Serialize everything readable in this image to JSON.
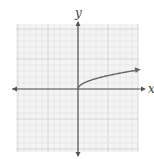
{
  "chart_data": {
    "type": "line",
    "title": "",
    "function": "y = sqrt(x)",
    "xlabel": "x",
    "ylabel": "y",
    "xlim": [
      -10,
      10
    ],
    "ylim": [
      -10,
      10
    ],
    "grid": true,
    "legend": null,
    "series": [
      {
        "name": "y = √x",
        "x": [
          0,
          0.25,
          1,
          2,
          4,
          6,
          8,
          10
        ],
        "values": [
          0,
          0.5,
          1,
          1.41,
          2,
          2.45,
          2.83,
          3.16
        ],
        "arrow_end": true
      }
    ]
  },
  "labels": {
    "x_axis": "x",
    "y_axis": "y"
  },
  "colors": {
    "grid_minor": "#e4e4e4",
    "grid_major": "#cfcfcf",
    "axis": "#555555",
    "curve": "#666666",
    "background": "#f4f4f4"
  }
}
